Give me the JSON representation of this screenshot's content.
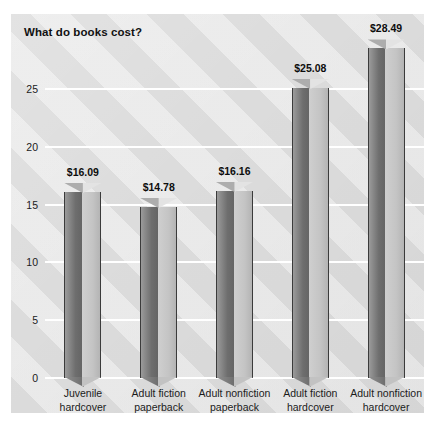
{
  "chart_data": {
    "type": "bar",
    "title": "What do books cost?",
    "xlabel": "",
    "ylabel": "",
    "ylim": [
      0,
      30
    ],
    "yticks": [
      0,
      5,
      10,
      15,
      20,
      25
    ],
    "ytick_labels": [
      "0",
      "5",
      "10",
      "15",
      "20",
      "25"
    ],
    "grid": true,
    "legend": "none",
    "style": "3d-triangular-prism-bars",
    "categories": [
      [
        "Juvenile",
        "hardcover"
      ],
      [
        "Adult fiction",
        "paperback"
      ],
      [
        "Adult nonfiction",
        "paperback"
      ],
      [
        "Adult fiction",
        "hardcover"
      ],
      [
        "Adult nonfiction",
        "hardcover"
      ]
    ],
    "category_labels": [
      "Juvenile hardcover",
      "Adult fiction paperback",
      "Adult nonfiction paperback",
      "Adult fiction hardcover",
      "Adult nonfiction hardcover"
    ],
    "values": [
      16.09,
      14.78,
      16.16,
      25.08,
      28.49
    ],
    "data_labels": [
      "$16.09",
      "$14.78",
      "$16.16",
      "$25.08",
      "$28.49"
    ],
    "colors": {
      "bar_left_face": "#6e6e6e",
      "bar_right_face": "#c4c4c4",
      "bar_outline": "#3b3b3b",
      "plot_background": "#dcdcdc",
      "gridline": "#ffffff",
      "text": "#111111",
      "page_background": "#ffffff"
    }
  }
}
